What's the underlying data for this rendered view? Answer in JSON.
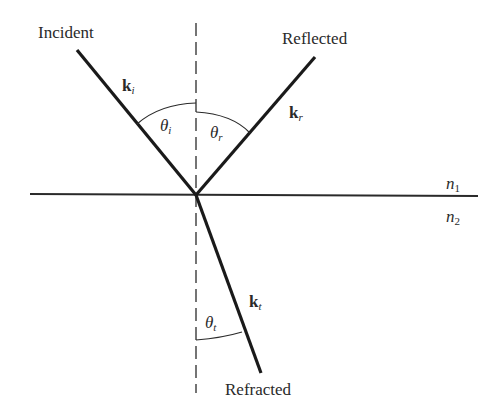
{
  "labels": {
    "incident": "Incident",
    "reflected": "Reflected",
    "refracted": "Refracted"
  },
  "vectors": {
    "k_i": {
      "base": "k",
      "sub": "i"
    },
    "k_r": {
      "base": "k",
      "sub": "r"
    },
    "k_t": {
      "base": "k",
      "sub": "t"
    }
  },
  "angles": {
    "theta_i": {
      "base": "θ",
      "sub": "i"
    },
    "theta_r": {
      "base": "θ",
      "sub": "r"
    },
    "theta_t": {
      "base": "θ",
      "sub": "t"
    }
  },
  "media": {
    "n1": {
      "base": "n",
      "sub": "1"
    },
    "n2": {
      "base": "n",
      "sub": "2"
    }
  },
  "colors": {
    "ray": "#1a1a1a",
    "line": "#2a2a2a",
    "background": "#ffffff"
  }
}
